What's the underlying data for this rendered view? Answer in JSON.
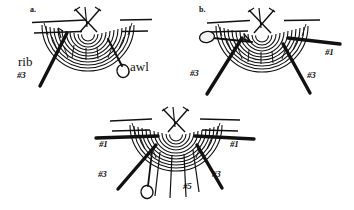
{
  "figure": {
    "background_color": "#ffffff",
    "ink_color": "#111111",
    "panels": [
      {
        "id": "a",
        "label": "a.",
        "label_x": 30,
        "label_y": 11,
        "annotations": [
          {
            "name": "rib-label",
            "text": "rib",
            "x": 18,
            "y": 62,
            "style": "word"
          },
          {
            "name": "rib-number-label",
            "text": "#3",
            "x": 17,
            "y": 77,
            "style": "num"
          },
          {
            "name": "awl-label",
            "text": "awl",
            "x": 126,
            "y": 66,
            "style": "word"
          }
        ]
      },
      {
        "id": "b",
        "label": "b.",
        "label_x": 199,
        "label_y": 11,
        "annotations": [
          {
            "name": "rib-number-label-left",
            "text": "#3",
            "x": 190,
            "y": 74,
            "style": "num"
          },
          {
            "name": "rib-number-label-right-upper",
            "text": "#1",
            "x": 324,
            "y": 52,
            "style": "num"
          },
          {
            "name": "rib-number-label-right-lower",
            "text": "#3",
            "x": 307,
            "y": 76,
            "style": "num"
          }
        ]
      },
      {
        "id": "c",
        "label": "",
        "label_x": 0,
        "label_y": 0,
        "annotations": [
          {
            "name": "rib-number-label-left-upper",
            "text": "#1",
            "x": 99,
            "y": 142,
            "style": "num"
          },
          {
            "name": "rib-number-label-right-upper",
            "text": "#1",
            "x": 228,
            "y": 142,
            "style": "num"
          },
          {
            "name": "rib-number-label-left-lower",
            "text": "#3",
            "x": 99,
            "y": 172,
            "style": "num"
          },
          {
            "name": "rib-number-label-right-lower",
            "text": "#3",
            "x": 211,
            "y": 172,
            "style": "num"
          },
          {
            "name": "rib-number-label-center",
            "text": "#5",
            "x": 182,
            "y": 184,
            "style": "num"
          }
        ]
      }
    ]
  }
}
